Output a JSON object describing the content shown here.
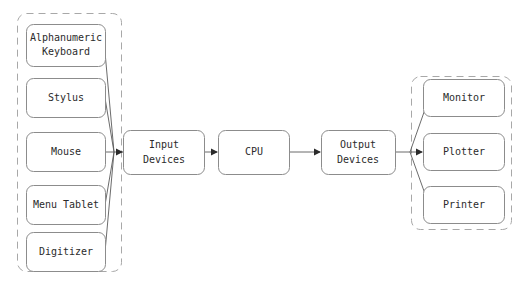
{
  "diagram": {
    "background_color": "#ffffff",
    "box_stroke_color": "#8c8c8c",
    "group_stroke_color": "#a8a8a8",
    "line_color": "#5a5a5a",
    "text_color": "#2b2b2b"
  },
  "input_group": {
    "name": "input-devices-group",
    "nodes": [
      {
        "id": "alphanumeric-keyboard",
        "label_line1": "Alphanumeric",
        "label_line2": "Keyboard"
      },
      {
        "id": "stylus",
        "label_line1": "Stylus",
        "label_line2": ""
      },
      {
        "id": "mouse",
        "label_line1": "Mouse",
        "label_line2": ""
      },
      {
        "id": "menu-tablet",
        "label_line1": "Menu Tablet",
        "label_line2": ""
      },
      {
        "id": "digitizer",
        "label_line1": "Digitizer",
        "label_line2": ""
      }
    ]
  },
  "pipeline": {
    "nodes": [
      {
        "id": "input-devices",
        "label_line1": "Input",
        "label_line2": "Devices"
      },
      {
        "id": "cpu",
        "label_line1": "CPU",
        "label_line2": ""
      },
      {
        "id": "output-devices",
        "label_line1": "Output",
        "label_line2": "Devices"
      }
    ]
  },
  "output_group": {
    "name": "output-devices-group",
    "nodes": [
      {
        "id": "monitor",
        "label_line1": "Monitor",
        "label_line2": ""
      },
      {
        "id": "plotter",
        "label_line1": "Plotter",
        "label_line2": ""
      },
      {
        "id": "printer",
        "label_line1": "Printer",
        "label_line2": ""
      }
    ]
  }
}
